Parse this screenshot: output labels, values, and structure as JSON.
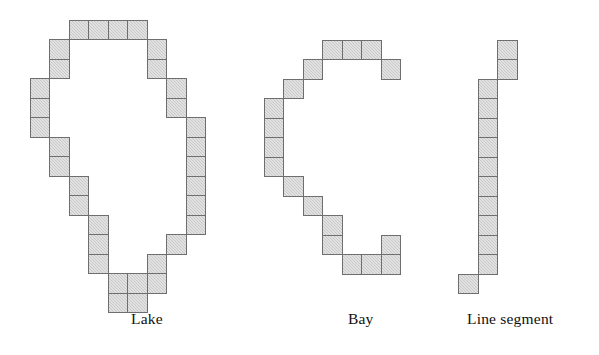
{
  "figure": {
    "background_color": "#ffffff",
    "cell_fill_color": "#c9c9c9",
    "cell_border_color": "#6e6e6e",
    "cell_size_px": 19.5,
    "shapes": [
      {
        "name": "lake",
        "caption": "Lake",
        "caption_x": 131,
        "caption_y": 310,
        "origin_x": 29.5,
        "origin_y": 19.5,
        "cells": [
          [
            2,
            0
          ],
          [
            3,
            0
          ],
          [
            4,
            0
          ],
          [
            5,
            0
          ],
          [
            1,
            1
          ],
          [
            6,
            1
          ],
          [
            1,
            2
          ],
          [
            6,
            2
          ],
          [
            0,
            3
          ],
          [
            7,
            3
          ],
          [
            0,
            4
          ],
          [
            7,
            4
          ],
          [
            0,
            5
          ],
          [
            8,
            5
          ],
          [
            1,
            6
          ],
          [
            8,
            6
          ],
          [
            1,
            7
          ],
          [
            8,
            7
          ],
          [
            2,
            8
          ],
          [
            8,
            8
          ],
          [
            2,
            9
          ],
          [
            8,
            9
          ],
          [
            3,
            10
          ],
          [
            8,
            10
          ],
          [
            3,
            11
          ],
          [
            7,
            11
          ],
          [
            3,
            12
          ],
          [
            6,
            12
          ],
          [
            4,
            13
          ],
          [
            5,
            13
          ],
          [
            6,
            13
          ],
          [
            4,
            14
          ],
          [
            5,
            14
          ]
        ]
      },
      {
        "name": "bay",
        "caption": "Bay",
        "caption_x": 348,
        "caption_y": 310,
        "origin_x": 263.5,
        "origin_y": 39.5,
        "cells": [
          [
            3,
            0
          ],
          [
            4,
            0
          ],
          [
            5,
            0
          ],
          [
            2,
            1
          ],
          [
            6,
            1
          ],
          [
            1,
            2
          ],
          [
            0,
            3
          ],
          [
            0,
            4
          ],
          [
            0,
            5
          ],
          [
            0,
            6
          ],
          [
            1,
            7
          ],
          [
            2,
            8
          ],
          [
            3,
            9
          ],
          [
            3,
            10
          ],
          [
            6,
            10
          ],
          [
            4,
            11
          ],
          [
            5,
            11
          ],
          [
            6,
            11
          ]
        ]
      },
      {
        "name": "line-segment",
        "caption": "Line segment",
        "caption_x": 467,
        "caption_y": 310,
        "origin_x": 477.5,
        "origin_y": 39.5,
        "cells": [
          [
            1,
            0
          ],
          [
            1,
            1
          ],
          [
            0,
            2
          ],
          [
            0,
            3
          ],
          [
            0,
            4
          ],
          [
            0,
            5
          ],
          [
            0,
            6
          ],
          [
            0,
            7
          ],
          [
            0,
            8
          ],
          [
            0,
            9
          ],
          [
            0,
            10
          ],
          [
            0,
            11
          ],
          [
            -1,
            12
          ]
        ]
      }
    ]
  }
}
